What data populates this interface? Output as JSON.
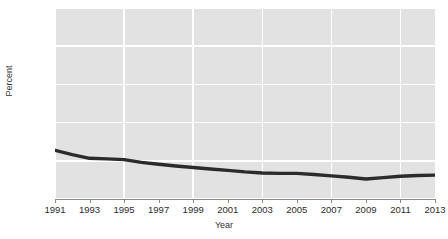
{
  "chart_data": {
    "type": "line",
    "title": "",
    "xlabel": "Year",
    "ylabel": "Percent",
    "xlim": [
      1991,
      2013
    ],
    "ylim": [
      0,
      100
    ],
    "grid": true,
    "legend": false,
    "x_ticks": [
      "1991",
      "1993",
      "1995",
      "1997",
      "1999",
      "2001",
      "2003",
      "2005",
      "2007",
      "2009",
      "2011",
      "2013"
    ],
    "y_ticks": [
      "0",
      "20",
      "40",
      "60",
      "80",
      "100"
    ],
    "line_color": "#2b2b2b",
    "panel_color": "#e2e2e2",
    "gridline_color": "#ffffff",
    "x": [
      1991,
      1992,
      1993,
      1994,
      1995,
      1996,
      1997,
      1998,
      1999,
      2000,
      2001,
      2002,
      2003,
      2004,
      2005,
      2006,
      2007,
      2008,
      2009,
      2010,
      2011,
      2012,
      2013
    ],
    "values": [
      25.5,
      23.2,
      21.3,
      21.0,
      20.6,
      19.2,
      18.2,
      17.3,
      16.5,
      15.7,
      15.0,
      14.2,
      13.6,
      13.4,
      13.4,
      12.8,
      12.1,
      11.4,
      10.5,
      11.2,
      11.9,
      12.3,
      12.5
    ],
    "series": [
      {
        "name": "Percent",
        "values": [
          25.5,
          23.2,
          21.3,
          21.0,
          20.6,
          19.2,
          18.2,
          17.3,
          16.5,
          15.7,
          15.0,
          14.2,
          13.6,
          13.4,
          13.4,
          12.8,
          12.1,
          11.4,
          10.5,
          11.2,
          11.9,
          12.3,
          12.5
        ]
      }
    ]
  }
}
